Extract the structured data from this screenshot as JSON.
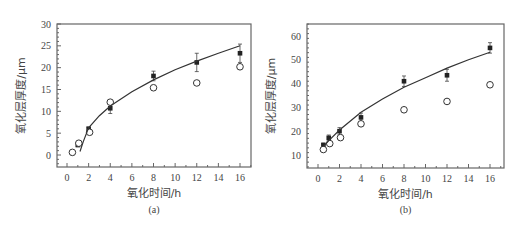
{
  "chart_data": [
    {
      "type": "scatter",
      "panel": "(a)",
      "xlabel": "氧化时间/h",
      "ylabel": "氧化层厚度/μm",
      "xlim": [
        -1,
        17.5
      ],
      "ylim": [
        -3,
        30
      ],
      "xticks": [
        0,
        2,
        4,
        6,
        8,
        10,
        12,
        14,
        16
      ],
      "yticks": [
        0,
        5,
        10,
        15,
        20,
        25,
        30
      ],
      "grid": false,
      "series": [
        {
          "name": "filled-squares",
          "marker": "filled-square",
          "x": [
            0.5,
            1,
            2,
            4,
            8,
            12,
            16
          ],
          "y": [
            0.5,
            2.3,
            6,
            10.7,
            18.1,
            21.2,
            23.3
          ],
          "yerr": [
            0.3,
            0.4,
            0.4,
            1.2,
            1.1,
            2.1,
            2.1
          ]
        },
        {
          "name": "open-circles",
          "marker": "open-circle",
          "x": [
            0.5,
            1,
            2,
            4,
            8,
            12,
            16
          ],
          "y": [
            0.6,
            2.7,
            5.2,
            12.1,
            15.4,
            16.5,
            20.2
          ]
        },
        {
          "name": "fit-curve",
          "marker": "line",
          "x": [
            1.2,
            1.5,
            2,
            3,
            4,
            6,
            8,
            10,
            12,
            14,
            16
          ],
          "y": [
            0.8,
            3,
            6.2,
            9,
            11.2,
            14.5,
            17.2,
            19.5,
            21.5,
            23.3,
            25
          ]
        }
      ]
    },
    {
      "type": "scatter",
      "panel": "(b)",
      "xlabel": "氧化时间/h",
      "ylabel": "氧化层厚度/μm",
      "xlim": [
        -1,
        17.5
      ],
      "ylim": [
        5,
        65
      ],
      "xticks": [
        0,
        2,
        4,
        6,
        8,
        10,
        12,
        14,
        16
      ],
      "yticks": [
        10,
        20,
        30,
        40,
        50,
        60
      ],
      "grid": false,
      "series": [
        {
          "name": "filled-squares",
          "marker": "filled-square",
          "x": [
            0.5,
            1,
            2,
            4,
            8,
            12,
            16
          ],
          "y": [
            14.2,
            17.2,
            20,
            25.8,
            41,
            43.5,
            55
          ],
          "yerr": [
            0.8,
            1.2,
            1.5,
            1.8,
            2.2,
            2.5,
            2.2
          ]
        },
        {
          "name": "open-circles",
          "marker": "open-circle",
          "x": [
            0.5,
            1,
            2,
            4,
            8,
            12,
            16
          ],
          "y": [
            12.3,
            14.8,
            17.3,
            23.1,
            29,
            32.5,
            39.5
          ]
        },
        {
          "name": "fit-curve",
          "marker": "line",
          "x": [
            0.5,
            1,
            2,
            4,
            6,
            8,
            10,
            12,
            14,
            16
          ],
          "y": [
            13.5,
            16,
            20.5,
            28,
            33.5,
            38.5,
            42.5,
            46.5,
            50,
            53.2
          ]
        }
      ]
    }
  ],
  "panels": {
    "a": {
      "label": "(a)",
      "xlabel": "氧化时间/h",
      "ylabel": "氧化层厚度/μm"
    },
    "b": {
      "label": "(b)",
      "xlabel": "氧化时间/h",
      "ylabel": "氧化层厚度/μm"
    }
  }
}
